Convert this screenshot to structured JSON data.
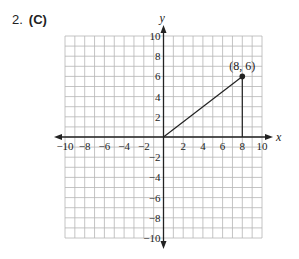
{
  "problem": {
    "number": "2.",
    "answer": "(C)"
  },
  "chart_data": {
    "type": "line",
    "title": "",
    "xlabel": "x",
    "ylabel": "y",
    "xlim": [
      -10,
      10
    ],
    "ylim": [
      -10,
      10
    ],
    "grid": true,
    "x_tick_labels": [
      "-10",
      "-8",
      "-6",
      "-4",
      "-2",
      "2",
      "4",
      "6",
      "8",
      "10"
    ],
    "y_tick_labels": [
      "10",
      "8",
      "6",
      "4",
      "2",
      "-2",
      "-4",
      "-6",
      "-8",
      "-10"
    ],
    "series": [
      {
        "name": "segment from origin",
        "points": [
          [
            0,
            0
          ],
          [
            8,
            6
          ]
        ]
      },
      {
        "name": "vertical drop",
        "points": [
          [
            8,
            6
          ],
          [
            8,
            0
          ]
        ]
      }
    ],
    "annotations": [
      {
        "text": "(8, 6)",
        "x": 8,
        "y": 6,
        "marker": "filled-dot"
      }
    ],
    "colors": {
      "grid": "#b5b5b5",
      "axis": "#222222",
      "line": "#222222"
    }
  }
}
